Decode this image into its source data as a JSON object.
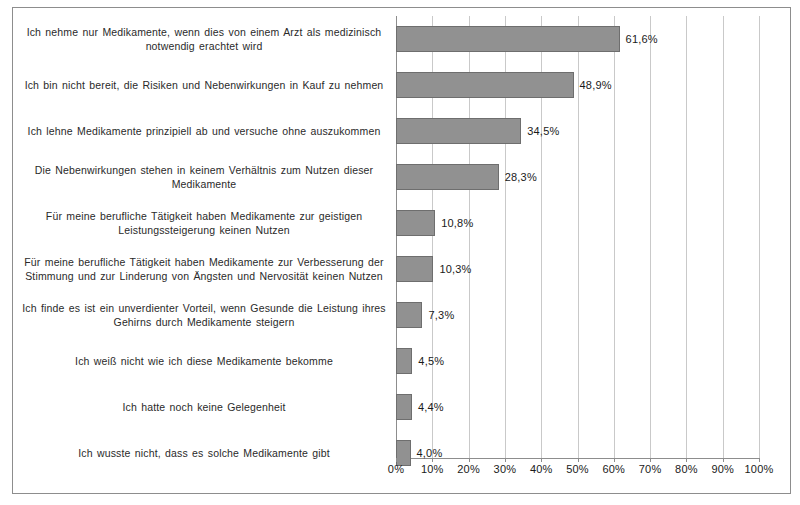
{
  "chart_data": {
    "type": "bar",
    "orientation": "horizontal",
    "title": "",
    "xlabel": "",
    "ylabel": "",
    "xlim": [
      0,
      100
    ],
    "grid": true,
    "legend": "none",
    "value_suffix": "%",
    "decimal_separator": ",",
    "bar_color": "#919191",
    "bar_border_color": "#6e6e6e",
    "gridline_color": "#c9c9c9",
    "axis_color": "#8d8d8d",
    "xticks": [
      0,
      10,
      20,
      30,
      40,
      50,
      60,
      70,
      80,
      90,
      100
    ],
    "xtick_labels": [
      "0%",
      "10%",
      "20%",
      "30%",
      "40%",
      "50%",
      "60%",
      "70%",
      "80%",
      "90%",
      "100%"
    ],
    "categories": [
      "Ich nehme nur Medikamente, wenn dies von einem Arzt als medizinisch notwendig erachtet wird",
      "Ich bin nicht bereit, die Risiken und Nebenwirkungen in Kauf zu nehmen",
      "Ich lehne Medikamente prinzipiell ab und versuche ohne auszukommen",
      "Die Nebenwirkungen stehen in keinem Verhältnis zum Nutzen dieser Medikamente",
      "Für meine berufliche Tätigkeit haben Medikamente zur geistigen Leistungssteigerung keinen Nutzen",
      "Für meine berufliche Tätigkeit haben Medikamente zur Verbesserung der Stimmung und zur Linderung von Ängsten und Nervosität keinen Nutzen",
      "Ich finde es ist ein unverdienter Vorteil, wenn Gesunde die Leistung ihres Gehirns durch Medikamente steigern",
      "Ich weiß nicht wie ich diese Medikamente bekomme",
      "Ich hatte noch keine Gelegenheit",
      "Ich wusste nicht, dass es solche Medikamente gibt"
    ],
    "values": [
      61.6,
      48.9,
      34.5,
      28.3,
      10.8,
      10.3,
      7.3,
      4.5,
      4.4,
      4.0
    ],
    "value_labels": [
      "61,6%",
      "48,9%",
      "34,5%",
      "28,3%",
      "10,8%",
      "10,3%",
      "7,3%",
      "4,5%",
      "4,4%",
      "4,0%"
    ]
  }
}
